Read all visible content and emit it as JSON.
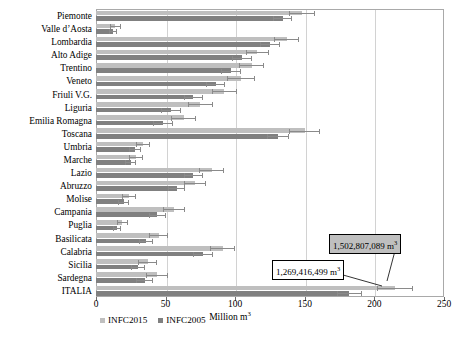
{
  "chart_data": {
    "type": "bar",
    "orientation": "horizontal",
    "title": "",
    "xlabel": "Million m3",
    "xlabel_display": "Million m",
    "xlabel_sup": "3",
    "ylabel": "",
    "xlim": [
      0,
      250
    ],
    "xticks": [
      0,
      50,
      100,
      150,
      200,
      250
    ],
    "grid": "vertical",
    "legend_position": "bottom-left",
    "categories": [
      "Piemonte",
      "Valle d’Aosta",
      "Lombardia",
      "Alto Adige",
      "Trentino",
      "Veneto",
      "Friuli V.G.",
      "Liguria",
      "Emilia Romagna",
      "Toscana",
      "Umbria",
      "Marche",
      "Lazio",
      "Abruzzo",
      "Molise",
      "Campania",
      "Puglia",
      "Basilicata",
      "Calabria",
      "Sicilia",
      "Sardegna",
      "ITALIA"
    ],
    "series": [
      {
        "name": "INFC2015",
        "color": "#bfbfbf",
        "values": [
          148,
          14,
          137,
          116,
          112,
          104,
          92,
          75,
          63,
          150,
          34,
          29,
          83,
          71,
          24,
          56,
          19,
          45,
          91,
          37,
          44,
          215
        ],
        "errors": [
          9,
          4,
          9,
          8,
          9,
          10,
          9,
          9,
          9,
          11,
          5,
          5,
          9,
          8,
          5,
          8,
          4,
          7,
          9,
          7,
          8,
          13
        ]
      },
      {
        "name": "INFC2005",
        "color": "#808080",
        "values": [
          134,
          12,
          125,
          105,
          97,
          86,
          70,
          54,
          48,
          131,
          28,
          25,
          70,
          58,
          20,
          44,
          15,
          36,
          77,
          30,
          35,
          182
        ],
        "errors": [
          7,
          3,
          7,
          7,
          7,
          7,
          7,
          7,
          7,
          8,
          4,
          4,
          7,
          6,
          4,
          6,
          3,
          5,
          7,
          5,
          6,
          9
        ]
      }
    ],
    "annotations": [
      {
        "id": "callout-infc2015",
        "text": "1,502,807,089 m",
        "sup": "3",
        "target_series": "INFC2015",
        "target_category": "ITALIA",
        "style": "gray-box"
      },
      {
        "id": "callout-infc2005",
        "text": "1,269,416,499 m",
        "sup": "3",
        "target_series": "INFC2005",
        "target_category": "ITALIA",
        "style": "white-box"
      }
    ]
  },
  "legend": {
    "items": [
      {
        "label": "INFC2015",
        "color": "#bfbfbf"
      },
      {
        "label": "INFC2005",
        "color": "#808080"
      }
    ]
  }
}
